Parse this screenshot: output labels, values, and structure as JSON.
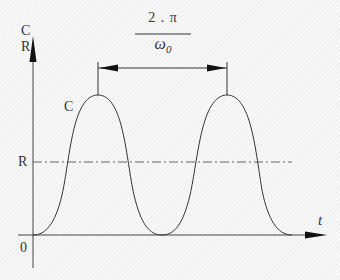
{
  "diagram": {
    "type": "periodic-waveform",
    "y_axis": {
      "label_top": "C",
      "label_bottom": "R"
    },
    "x_axis": {
      "label": "t",
      "origin_label": "0"
    },
    "curve_label": "C",
    "reference_line_label": "R",
    "period_annotation": {
      "numerator": "2 . π",
      "denominator": "ω",
      "denominator_subscript": "0"
    },
    "colors": {
      "stroke": "#333333",
      "reference_line": "#666666",
      "background": "#f4f4f4"
    }
  }
}
